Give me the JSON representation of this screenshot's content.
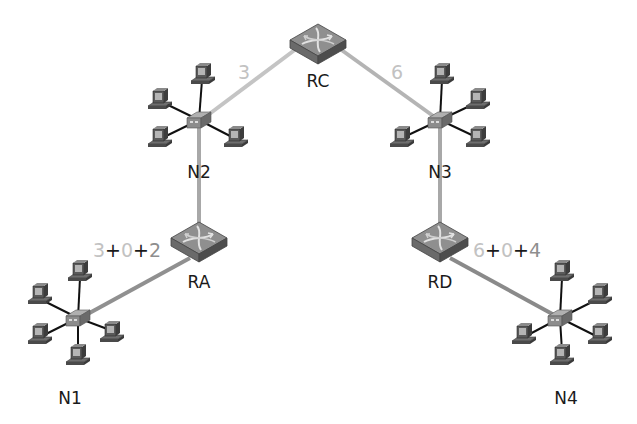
{
  "colors": {
    "link_light": "#c4c4c4",
    "link_mid": "#9a9a9a",
    "link_dark": "#8a8a8a",
    "metric_light": "#c2c2c2",
    "metric_mid": "#8e8e8e",
    "metric_plus": "#1a1a1a",
    "label": "#1a1a1a"
  },
  "routers": [
    {
      "id": "RC",
      "label": "RC",
      "x": 318,
      "y": 40
    },
    {
      "id": "RA",
      "label": "RA",
      "x": 199,
      "y": 243
    },
    {
      "id": "RD",
      "label": "RD",
      "x": 440,
      "y": 243
    }
  ],
  "networks": [
    {
      "id": "N1",
      "label": "N1",
      "hub_x": 78,
      "hub_y": 318,
      "label_x": 70,
      "label_y": 402
    },
    {
      "id": "N2",
      "label": "N2",
      "hub_x": 199,
      "hub_y": 120,
      "label_x": 199,
      "label_y": 175
    },
    {
      "id": "N3",
      "label": "N3",
      "hub_x": 440,
      "hub_y": 120,
      "label_x": 440,
      "label_y": 175
    },
    {
      "id": "N4",
      "label": "N4",
      "hub_x": 560,
      "hub_y": 318,
      "label_x": 566,
      "label_y": 402
    }
  ],
  "links": [
    {
      "from": "N2",
      "to": "RC",
      "metric": "3"
    },
    {
      "from": "RC",
      "to": "N3",
      "metric": "6"
    },
    {
      "from": "N2",
      "to": "RA",
      "metric": ""
    },
    {
      "from": "N3",
      "to": "RD",
      "metric": ""
    },
    {
      "from": "RA",
      "to": "N1",
      "metric": ""
    },
    {
      "from": "RD",
      "to": "N4",
      "metric": ""
    }
  ],
  "metrics": {
    "n2_rc": "3",
    "rc_n3": "6",
    "ra": {
      "a": "3",
      "op1": "+",
      "b": "0",
      "op2": "+",
      "c": "2"
    },
    "rd": {
      "a": "6",
      "op1": "+",
      "b": "0",
      "op2": "+",
      "c": "4"
    }
  }
}
